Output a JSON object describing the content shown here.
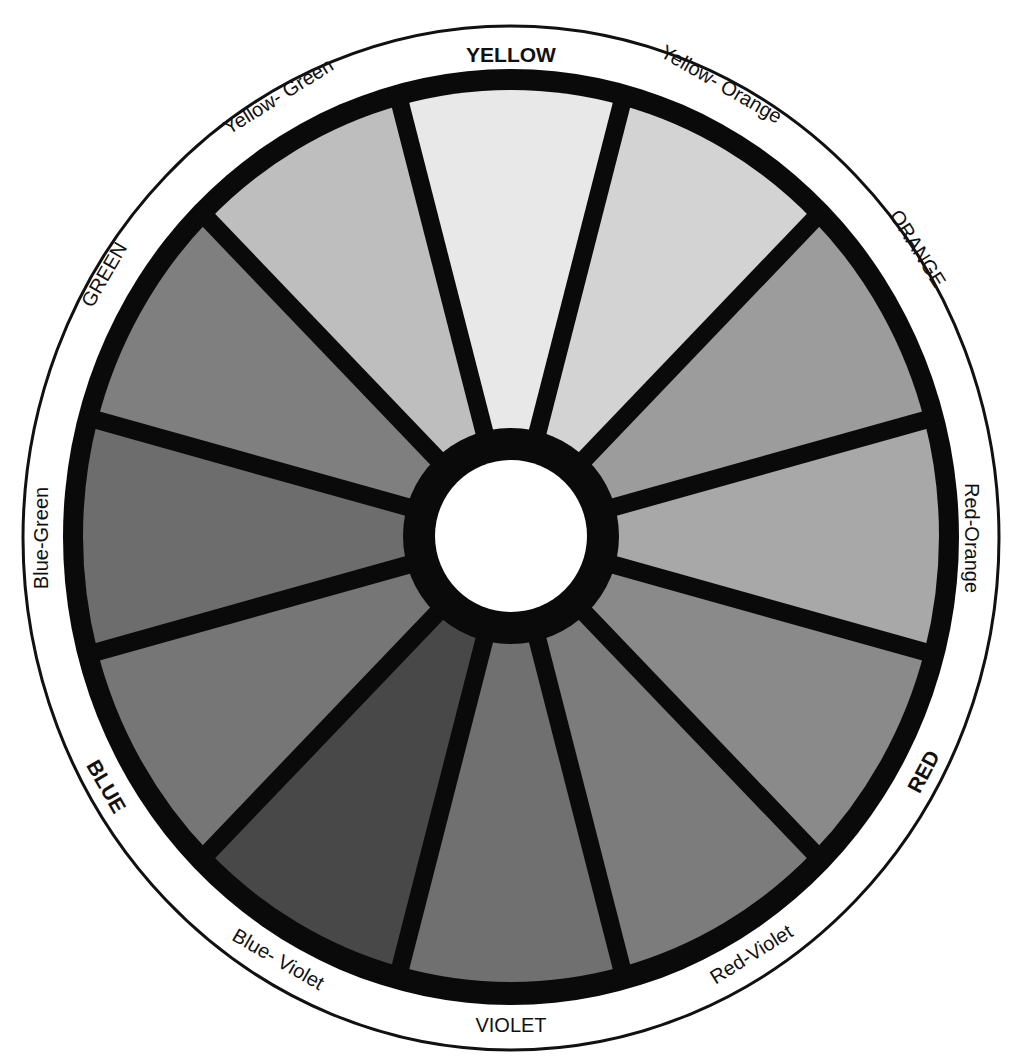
{
  "diagram": {
    "center": {
      "x": 511,
      "y": 536
    },
    "outer_rim": {
      "rx": 488,
      "ry": 512,
      "stroke": "#111111"
    },
    "black_ring": {
      "rx": 448,
      "ry": 468,
      "color": "#0a0a0a"
    },
    "slice_area": {
      "rx": 428,
      "ry": 446
    },
    "hub": {
      "outer_r": 108,
      "inner_r": 76,
      "ring_color": "#0a0a0a",
      "fill": "#ffffff"
    },
    "spoke_width": 18,
    "segments": [
      {
        "name": "YELLOW",
        "type": "primary",
        "gray": "#e8e8e8"
      },
      {
        "name": "Yellow- Orange",
        "type": "tertiary",
        "gray": "#d3d3d3"
      },
      {
        "name": "ORANGE",
        "type": "secondary",
        "gray": "#9c9c9c"
      },
      {
        "name": "Red-Orange",
        "type": "tertiary",
        "gray": "#a8a8a8"
      },
      {
        "name": "RED",
        "type": "primary",
        "gray": "#8a8a8a"
      },
      {
        "name": "Red-Violet",
        "type": "tertiary",
        "gray": "#7c7c7c"
      },
      {
        "name": "VIOLET",
        "type": "secondary",
        "gray": "#707070"
      },
      {
        "name": "Blue- Violet",
        "type": "tertiary",
        "gray": "#484848"
      },
      {
        "name": "BLUE",
        "type": "primary",
        "gray": "#767676"
      },
      {
        "name": "Blue-Green",
        "type": "tertiary",
        "gray": "#6d6d6d"
      },
      {
        "name": "GREEN",
        "type": "secondary",
        "gray": "#7f7f7f"
      },
      {
        "name": "Yellow- Green",
        "type": "tertiary",
        "gray": "#bebebe"
      }
    ]
  },
  "labels": {
    "yellow": "YELLOW",
    "yellow_orange": "Yellow- Orange",
    "orange": "ORANGE",
    "red_orange": "Red-Orange",
    "red": "RED",
    "red_violet": "Red-Violet",
    "violet": "VIOLET",
    "blue_violet": "Blue- Violet",
    "blue": "BLUE",
    "blue_green": "Blue-Green",
    "green": "GREEN",
    "yellow_green": "Yellow- Green"
  }
}
